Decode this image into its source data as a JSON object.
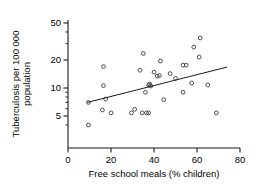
{
  "chart_data": {
    "type": "scatter",
    "title": "",
    "xlabel": "Free school meals (% children)",
    "ylabel": "Tuberculosis per 100 000 population",
    "ylabel_line1": "Tuberculosis per 100 000",
    "ylabel_line2": "population",
    "yscale": "log",
    "xscale": "linear",
    "xlim": [
      0,
      80
    ],
    "ylim": [
      3.5,
      60
    ],
    "xticks": [
      0,
      20,
      40,
      60,
      80
    ],
    "xtick_labels": [
      "0",
      "20",
      "40",
      "60",
      "80"
    ],
    "yticks": [
      5,
      10,
      20,
      50
    ],
    "ytick_labels": [
      "5",
      "10",
      "20",
      "50"
    ],
    "yminor_ticks": [
      4,
      6,
      7,
      8,
      9,
      30,
      40
    ],
    "grid": false,
    "legend": null,
    "marker": "open-circle",
    "marker_color": "#3b3b46",
    "line_color": "#1a1a1a",
    "points": [
      {
        "x": 9.5,
        "y": 4.0
      },
      {
        "x": 9.5,
        "y": 7.0
      },
      {
        "x": 16.0,
        "y": 5.8
      },
      {
        "x": 16.5,
        "y": 10.6
      },
      {
        "x": 16.5,
        "y": 17.0
      },
      {
        "x": 17.5,
        "y": 7.6
      },
      {
        "x": 20.0,
        "y": 5.4
      },
      {
        "x": 29.5,
        "y": 5.4
      },
      {
        "x": 31.0,
        "y": 5.9
      },
      {
        "x": 33.5,
        "y": 15.5
      },
      {
        "x": 34.5,
        "y": 5.4
      },
      {
        "x": 35.0,
        "y": 23.5
      },
      {
        "x": 36.0,
        "y": 9.0
      },
      {
        "x": 36.5,
        "y": 5.4
      },
      {
        "x": 37.5,
        "y": 5.4
      },
      {
        "x": 37.5,
        "y": 10.8
      },
      {
        "x": 38.0,
        "y": 11.0
      },
      {
        "x": 38.5,
        "y": 10.5
      },
      {
        "x": 40.0,
        "y": 14.8
      },
      {
        "x": 41.5,
        "y": 13.4
      },
      {
        "x": 42.5,
        "y": 13.6
      },
      {
        "x": 43.0,
        "y": 19.5
      },
      {
        "x": 44.5,
        "y": 7.5
      },
      {
        "x": 47.5,
        "y": 14.3
      },
      {
        "x": 50.0,
        "y": 12.7
      },
      {
        "x": 53.5,
        "y": 9.0
      },
      {
        "x": 53.5,
        "y": 17.6
      },
      {
        "x": 55.0,
        "y": 17.6
      },
      {
        "x": 57.5,
        "y": 11.3
      },
      {
        "x": 58.5,
        "y": 27.5
      },
      {
        "x": 61.0,
        "y": 21.5
      },
      {
        "x": 61.5,
        "y": 34.5
      },
      {
        "x": 65.0,
        "y": 10.8
      },
      {
        "x": 69.0,
        "y": 5.4
      }
    ],
    "fit_line": {
      "x0": 9.0,
      "y0": 7.0,
      "x1": 74.0,
      "y1": 16.8
    }
  }
}
